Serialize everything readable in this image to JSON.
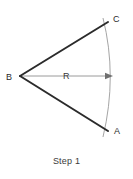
{
  "figure": {
    "caption": "Step 1",
    "background_color": "#ffffff",
    "stroke_colors": {
      "rays": "#2b2b2b",
      "arc": "#a5a5a5",
      "radius_line": "#9a9a9a",
      "label_text": "#2b2b2b"
    },
    "labels": {
      "vertex_b": "B",
      "point_c": "C",
      "point_a": "A",
      "radius": "R"
    },
    "geometry": {
      "vertex": {
        "x": 20,
        "y": 76
      },
      "ray_to_c_end": {
        "x": 108,
        "y": 22
      },
      "ray_to_a_end": {
        "x": 108,
        "y": 131
      },
      "arc_start": {
        "x": 103,
        "y": 18
      },
      "arc_mid": {
        "x": 113,
        "y": 76
      },
      "arc_end": {
        "x": 103,
        "y": 137
      },
      "radius_arrow_tip": {
        "x": 113,
        "y": 76
      },
      "radius_value": "R"
    }
  }
}
